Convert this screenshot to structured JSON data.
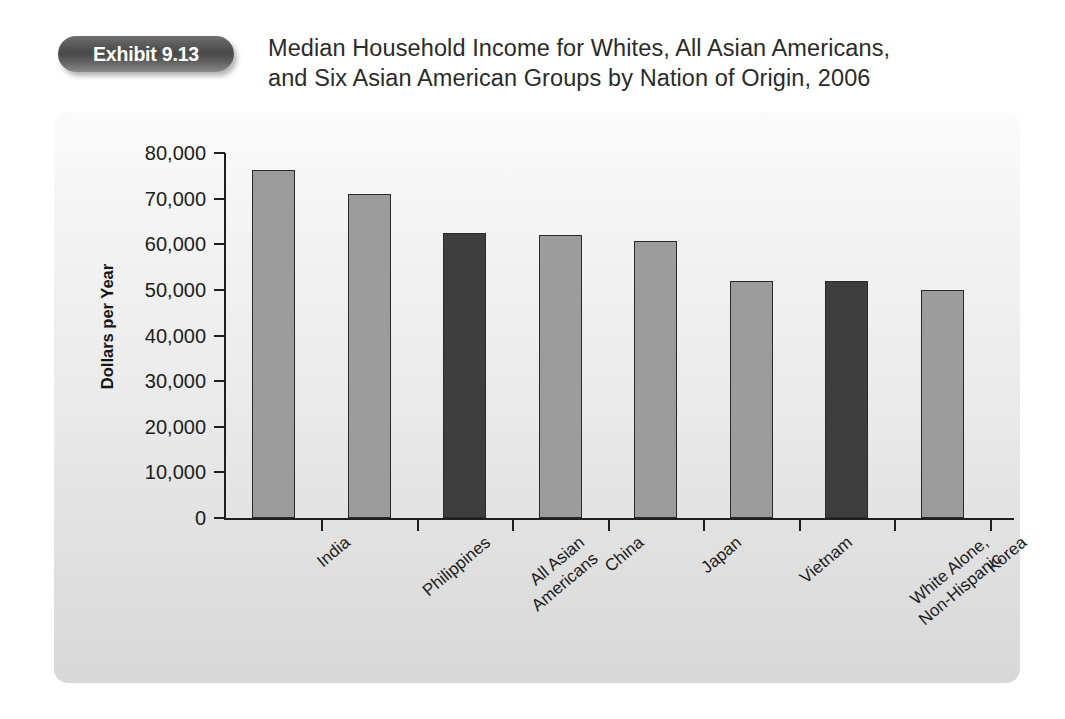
{
  "header": {
    "exhibit_badge": "Exhibit 9.13",
    "title_line1": "Median Household Income for Whites, All Asian Americans,",
    "title_line2": "and Six Asian American Groups by Nation of Origin, 2006"
  },
  "colors": {
    "bar_light": "#9c9c9c",
    "bar_dark": "#3e3e3e",
    "axis": "#1f1f1f",
    "badge": "#4a4a4a",
    "panel_bg": "#eaeaea"
  },
  "chart_data": {
    "type": "bar",
    "title": "Median Household Income for Whites, All Asian Americans, and Six Asian American Groups by Nation of Origin, 2006",
    "xlabel": "",
    "ylabel": "Dollars per Year",
    "ylim": [
      0,
      80000
    ],
    "ytick_labels": [
      "80,000",
      "70,000",
      "60,000",
      "50,000",
      "40,000",
      "30,000",
      "20,000",
      "10,000",
      "0"
    ],
    "ytick_values": [
      80000,
      70000,
      60000,
      50000,
      40000,
      30000,
      20000,
      10000,
      0
    ],
    "grid": false,
    "legend": "none",
    "categories": [
      "India",
      "Philippines",
      "All Asian Americans",
      "China",
      "Japan",
      "Vietnam",
      "White Alone, Non-Hispanic",
      "Korea"
    ],
    "category_lines": [
      [
        "India"
      ],
      [
        "Philippines"
      ],
      [
        "All Asian",
        "Americans"
      ],
      [
        "China"
      ],
      [
        "Japan"
      ],
      [
        "Vietnam"
      ],
      [
        "White Alone,",
        "Non-Hispanic"
      ],
      [
        "Korea"
      ]
    ],
    "values": [
      76200,
      71000,
      62500,
      62100,
      60700,
      52000,
      51900,
      50000
    ],
    "bar_styles": [
      "light",
      "light",
      "dark",
      "light",
      "light",
      "light",
      "dark",
      "light"
    ]
  }
}
